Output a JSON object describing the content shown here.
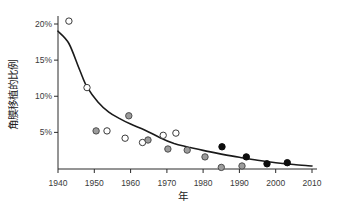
{
  "chart_data": {
    "type": "scatter",
    "title": "",
    "xlabel": "年",
    "ylabel": "角膜移植的比例",
    "xlim": [
      1938,
      2012
    ],
    "ylim": [
      0,
      21
    ],
    "grid": false,
    "legend": "none",
    "x_ticks": [
      1940,
      1950,
      1960,
      1970,
      1980,
      1990,
      2000,
      2010
    ],
    "x_tick_labels": [
      "1940",
      "1950",
      "1960",
      "1970",
      "1980",
      "1990",
      "2000",
      "2010"
    ],
    "y_ticks": [
      5,
      10,
      15,
      20
    ],
    "y_tick_labels": [
      "5%",
      "10%",
      "15%",
      "20%"
    ],
    "marker_radius": 3.2,
    "series": [
      {
        "name": "open-circle",
        "marker": "circle-open",
        "fill": "#ffffff",
        "stroke": "#3a3a3a",
        "points": [
          [
            1943,
            20.4
          ],
          [
            1948,
            11.2
          ],
          [
            1953.5,
            5.2
          ],
          [
            1958.5,
            4.2
          ],
          [
            1963.3,
            3.6
          ],
          [
            1969,
            4.6
          ],
          [
            1972.5,
            4.9
          ]
        ]
      },
      {
        "name": "gray-circle",
        "marker": "circle-gray",
        "fill": "#9c9c9c",
        "stroke": "#4d4d4d",
        "points": [
          [
            1950.5,
            5.2
          ],
          [
            1959.5,
            7.3
          ],
          [
            1964.8,
            3.95
          ],
          [
            1970.3,
            2.7
          ],
          [
            1975.6,
            2.55
          ],
          [
            1980.5,
            1.6
          ],
          [
            1985,
            0.15
          ],
          [
            1990.7,
            0.35
          ]
        ]
      },
      {
        "name": "black-circle",
        "marker": "circle-black",
        "fill": "#0d0d0d",
        "stroke": "#0d0d0d",
        "points": [
          [
            1985.2,
            3.0
          ],
          [
            1991.9,
            1.6
          ],
          [
            1997.6,
            0.65
          ],
          [
            2003.2,
            0.8
          ]
        ]
      }
    ],
    "trend_line": {
      "color": "#1a1a1a",
      "width": 1.6,
      "points": [
        [
          1940,
          19.0
        ],
        [
          1943,
          17.3
        ],
        [
          1946,
          13.6
        ],
        [
          1948,
          11.3
        ],
        [
          1951,
          9.2
        ],
        [
          1954,
          7.8
        ],
        [
          1957,
          6.9
        ],
        [
          1960,
          6.15
        ],
        [
          1964,
          5.3
        ],
        [
          1968,
          4.3
        ],
        [
          1972,
          3.45
        ],
        [
          1976,
          2.95
        ],
        [
          1980,
          2.5
        ],
        [
          1985,
          2.0
        ],
        [
          1990,
          1.55
        ],
        [
          1995,
          1.15
        ],
        [
          2000,
          0.8
        ],
        [
          2005,
          0.55
        ],
        [
          2010,
          0.35
        ]
      ]
    }
  },
  "colors": {
    "background": "#ffffff",
    "axis": "#2b2b2b",
    "tick_text": "#3a3a3a",
    "title_text": "#222222"
  }
}
